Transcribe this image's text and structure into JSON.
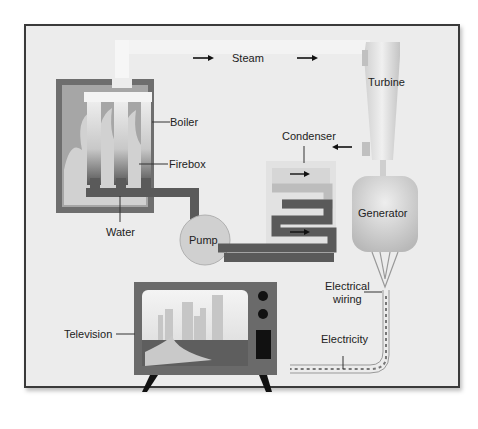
{
  "diagram": {
    "type": "power-plant-energy-flow",
    "labels": {
      "steam": "Steam",
      "turbine": "Turbine",
      "boiler": "Boiler",
      "firebox": "Firebox",
      "condenser": "Condenser",
      "water": "Water",
      "pump": "Pump",
      "generator": "Generator",
      "electrical_wiring_line1": "Electrical",
      "electrical_wiring_line2": "wiring",
      "electricity": "Electricity",
      "television": "Television"
    },
    "colors": {
      "frame_border": "#3a3a3a",
      "background": "#ececec",
      "boiler_wall": "#6e6e6e",
      "pipe_dark": "#5a5a5a",
      "pipe_light": "#bdbdbd",
      "pump": "#d0d0d0",
      "tv_body": "#6a6a6a"
    }
  }
}
